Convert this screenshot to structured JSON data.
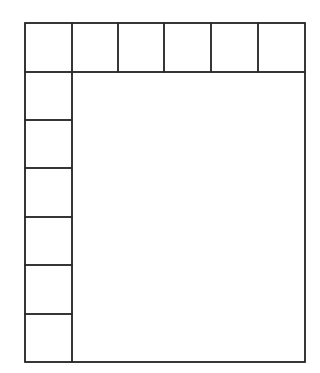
{
  "diagram": {
    "stroke_color": "#2a2a2a",
    "background": "#ffffff",
    "outer": {
      "x": 25,
      "y": 23,
      "width": 280,
      "height": 339
    },
    "top_row": {
      "y": 23,
      "height": 49,
      "column_edges_x": [
        25,
        72,
        118,
        164,
        211,
        258,
        305
      ],
      "cell_count": 6
    },
    "left_column": {
      "x": 25,
      "width": 47,
      "row_edges_y": [
        72,
        120,
        168,
        217,
        265,
        314,
        362
      ],
      "cell_count": 6
    },
    "main_area": {
      "x": 72,
      "y": 72,
      "width": 233,
      "height": 290
    }
  }
}
